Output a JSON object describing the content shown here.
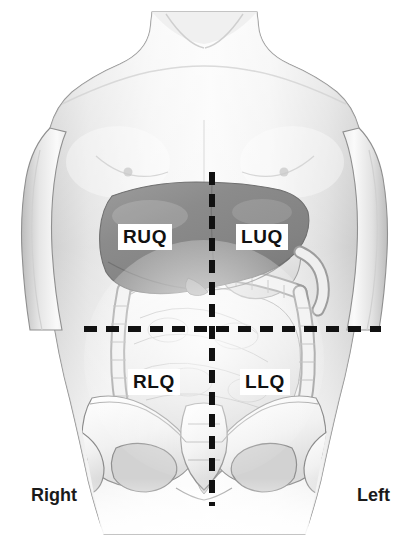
{
  "figure": {
    "background_color": "#ffffff"
  },
  "quadrants": [
    {
      "id": "ruq",
      "label": "RUQ",
      "name": "Right Upper Quadrant",
      "x": 118,
      "y": 224
    },
    {
      "id": "luq",
      "label": "LUQ",
      "name": "Left Upper Quadrant",
      "x": 236,
      "y": 224
    },
    {
      "id": "rlq",
      "label": "RLQ",
      "name": "Right Lower Quadrant",
      "x": 128,
      "y": 369
    },
    {
      "id": "llq",
      "label": "LLQ",
      "name": "Left Lower Quadrant",
      "x": 240,
      "y": 369
    }
  ],
  "orientation": {
    "right_label": "Right",
    "left_label": "Left"
  },
  "divider_lines": {
    "vertical": {
      "x": 212,
      "y_start": 172,
      "y_end": 506,
      "style": "dashed",
      "color": "#111111"
    },
    "horizontal": {
      "y": 329,
      "x_start": 84,
      "x_end": 381,
      "style": "dashed",
      "color": "#111111"
    }
  },
  "colors": {
    "skin_light": "#f2f2f2",
    "skin_mid": "#dcdcdc",
    "skin_shade": "#c6c6c6",
    "outline": "#6b6b6b",
    "liver": "#8d8d8d",
    "liver_dark": "#7a7a7a",
    "organ_light": "#ececec",
    "organ_line": "#9a9a9a",
    "bone": "#f4f4f4",
    "bone_line": "#8c8c8c",
    "dash": "#111111",
    "label_text": "#111111",
    "label_bg": "#ffffff"
  },
  "anatomy": {
    "body_part": "anterior torso",
    "structures": [
      "torso-silhouette",
      "left-arm",
      "right-arm",
      "neck",
      "liver",
      "stomach",
      "transverse-colon",
      "ascending-colon",
      "descending-colon",
      "small-intestine",
      "sigmoid-colon",
      "pelvis",
      "sacrum",
      "femur-head-left",
      "femur-head-right"
    ]
  }
}
